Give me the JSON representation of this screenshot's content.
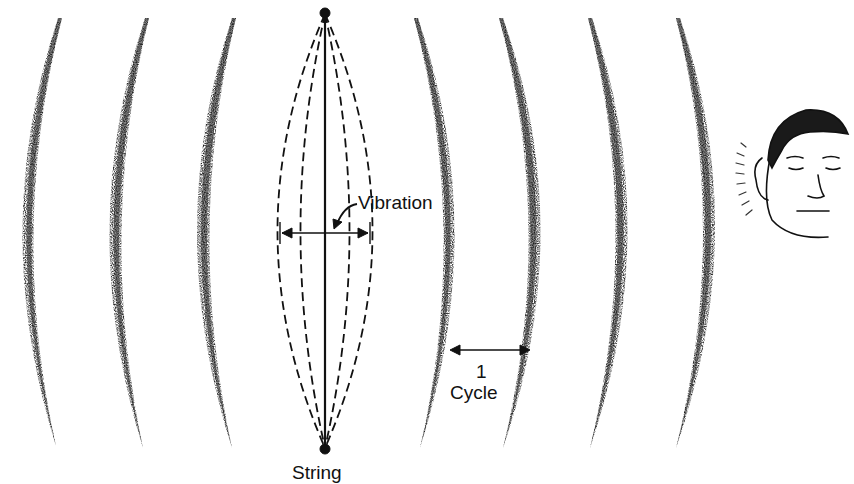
{
  "diagram": {
    "labels": {
      "vibration": "Vibration",
      "cycle_number": "1",
      "cycle_word": "Cycle",
      "string": "String"
    },
    "colors": {
      "ink": "#111111",
      "background": "#ffffff",
      "wave_stipple": "#222222"
    },
    "wavefronts": {
      "left_count": 3,
      "right_count": 4,
      "left_centers_x": [
        22,
        110,
        196
      ],
      "right_centers_x": [
        440,
        530,
        615,
        703
      ]
    },
    "icons": [
      "string-icon",
      "sound-wave-icon",
      "listener-face-icon",
      "sound-lines-icon"
    ]
  }
}
